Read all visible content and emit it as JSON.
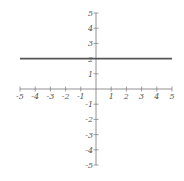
{
  "chart_data": {
    "type": "line",
    "title": "",
    "xlabel": "",
    "ylabel": "",
    "xlim": [
      -5,
      5
    ],
    "ylim": [
      -5,
      5
    ],
    "grid": false,
    "x_ticks": [
      "-5",
      "-4",
      "-3",
      "-2",
      "-1",
      "1",
      "2",
      "3",
      "4",
      "5"
    ],
    "y_ticks": [
      "5",
      "4",
      "3",
      "2",
      "1",
      "-1",
      "-2",
      "-3",
      "-4",
      "-5"
    ],
    "series": [
      {
        "name": "y = 2",
        "x": [
          -5,
          5
        ],
        "y": [
          2,
          2
        ],
        "color": "#555555"
      }
    ]
  },
  "colors": {
    "axis": "#777777",
    "line": "#555555",
    "labels": "#555555"
  }
}
